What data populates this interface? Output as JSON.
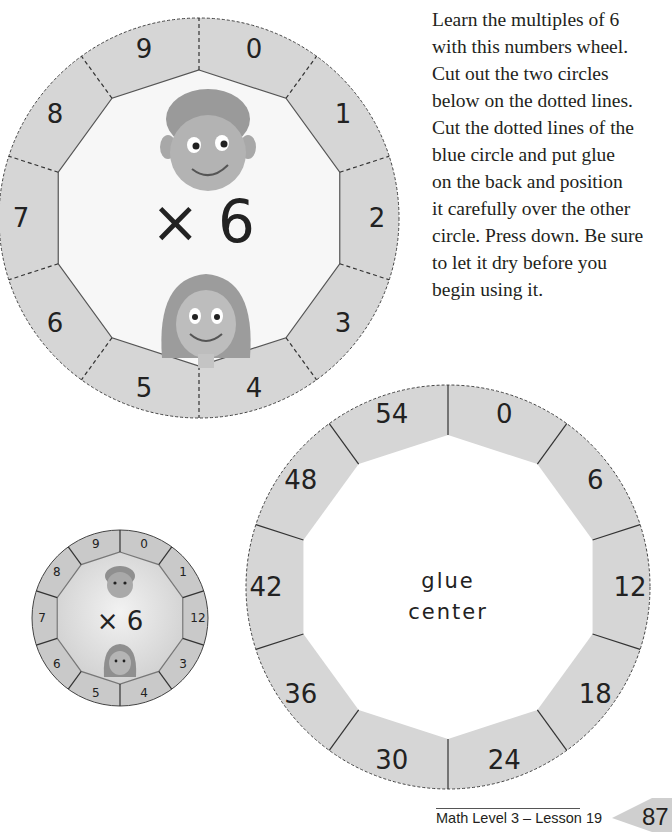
{
  "instructions": {
    "lines": [
      "Learn the multiples of 6",
      "with this numbers wheel.",
      "Cut out the two circles",
      "below on the dotted lines.",
      "Cut the dotted lines of the",
      "blue circle and put glue",
      "on the back and position",
      "it carefully over the other",
      "circle. Press down. Be sure",
      "to let it dry before you",
      "begin using it."
    ]
  },
  "top_wheel": {
    "center_label": "× 6",
    "segments": [
      "0",
      "1",
      "2",
      "3",
      "4",
      "5",
      "6",
      "7",
      "8",
      "9"
    ],
    "images": [
      "boy-face",
      "girl-face"
    ]
  },
  "bottom_wheel": {
    "center_line1": "glue",
    "center_line2": "center",
    "segments": [
      "0",
      "6",
      "12",
      "18",
      "24",
      "30",
      "36",
      "42",
      "48",
      "54"
    ]
  },
  "example_photo": {
    "center_label": "× 6",
    "segments": [
      "0",
      "1",
      "12",
      "3",
      "4",
      "5",
      "6",
      "7",
      "8",
      "9"
    ]
  },
  "footer": {
    "title": "Math Level 3 – Lesson 19",
    "page_number": "87"
  },
  "colors": {
    "ring": "#d6d6d6",
    "inner": "#f7f7f7",
    "text": "#231f20",
    "page_tab": "#cfcfcf"
  }
}
